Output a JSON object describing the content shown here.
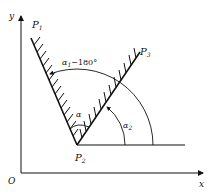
{
  "diagram": {
    "axes": {
      "origin_label": "O",
      "x_label": "x",
      "y_label": "y"
    },
    "points": {
      "p1": {
        "base": "P",
        "sub": "1"
      },
      "p2": {
        "base": "P",
        "sub": "2"
      },
      "p3": {
        "base": "P",
        "sub": "3"
      }
    },
    "angles": {
      "alpha": "α",
      "alpha2_base": "α",
      "alpha2_sub": "2",
      "alpha1_base": "α",
      "alpha1_sub": "1",
      "alpha1_suffix": "−180°"
    },
    "colors": {
      "stroke": "#111111",
      "background": "#ffffff"
    }
  }
}
